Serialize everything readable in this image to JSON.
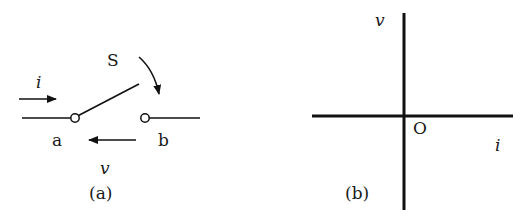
{
  "figure_a": {
    "caption": "(a)",
    "switch_label": "S",
    "current_label": "i",
    "voltage_label": "v",
    "terminal_a": "a",
    "terminal_b": "b"
  },
  "figure_b": {
    "caption": "(b)",
    "y_axis_label": "v",
    "x_axis_label": "i",
    "origin_label": "O"
  },
  "colors": {
    "stroke": "#111111",
    "background": "#ffffff"
  }
}
